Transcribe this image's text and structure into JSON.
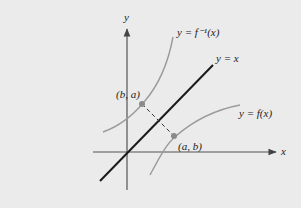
{
  "diagram": {
    "colors": {
      "background": "#ebebeb",
      "axes": "#555555",
      "identity_line": "#1a1a1a",
      "curves": "#9a9a9a",
      "points": "#8a8a8a"
    },
    "axes": {
      "x_label": "x",
      "y_label": "y"
    },
    "curves": {
      "inverse_label": "y = f⁻¹(x)",
      "function_label": "y = f(x)",
      "identity_label": "y = x"
    },
    "points": {
      "on_inverse": "(b, a)",
      "on_function": "(a, b)"
    }
  }
}
